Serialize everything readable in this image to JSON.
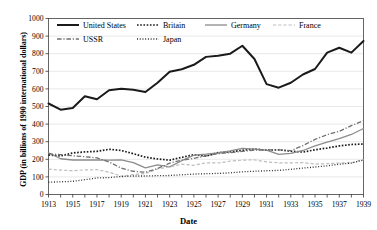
{
  "chart_data": {
    "type": "line",
    "title": "",
    "xlabel": "Date",
    "ylabel": "GDP (in billions of 1990 international dollars)",
    "xlim": [
      1913,
      1939
    ],
    "ylim": [
      0,
      1000
    ],
    "ytick_step": 100,
    "xtick_step": 1,
    "xtick_label_step": 2,
    "grid": true,
    "legend_position": "top-left-inside",
    "x": [
      1913,
      1914,
      1915,
      1916,
      1917,
      1918,
      1919,
      1920,
      1921,
      1922,
      1923,
      1924,
      1925,
      1926,
      1927,
      1928,
      1929,
      1930,
      1931,
      1932,
      1933,
      1934,
      1935,
      1936,
      1937,
      1938,
      1939
    ],
    "xticklabels": [
      "1913",
      "",
      "1915",
      "",
      "1917",
      "",
      "1919",
      "",
      "1921",
      "",
      "1923",
      "",
      "1925",
      "",
      "1927",
      "",
      "1929",
      "",
      "1931",
      "",
      "1933",
      "",
      "1935",
      "",
      "1937",
      "",
      "1939"
    ],
    "yticklabels": [
      "0",
      "100",
      "200",
      "300",
      "400",
      "500",
      "600",
      "700",
      "800",
      "900",
      "1000"
    ],
    "series": [
      {
        "name": "United States",
        "color": "#1a1a1a",
        "width": 2.0,
        "dash": "none",
        "values": [
          517,
          482,
          492,
          558,
          541,
          592,
          601,
          595,
          582,
          635,
          697,
          712,
          737,
          782,
          789,
          800,
          845,
          770,
          627,
          607,
          635,
          682,
          713,
          806,
          834,
          806,
          872
        ]
      },
      {
        "name": "Britain",
        "color": "#1a1a1a",
        "width": 1.7,
        "dash": "dotted",
        "values": [
          225,
          219,
          236,
          242,
          245,
          257,
          250,
          232,
          212,
          202,
          195,
          211,
          226,
          218,
          238,
          243,
          251,
          258,
          252,
          254,
          246,
          241,
          254,
          264,
          276,
          284,
          287
        ]
      },
      {
        "name": "Germany",
        "color": "#8c8c8c",
        "width": 1.3,
        "dash": "none",
        "values": [
          237,
          203,
          196,
          197,
          196,
          195,
          197,
          181,
          151,
          168,
          157,
          192,
          223,
          229,
          237,
          248,
          262,
          258,
          252,
          228,
          234,
          250,
          276,
          297,
          317,
          341,
          375
        ]
      },
      {
        "name": "France",
        "color": "#bdbdbd",
        "width": 1.2,
        "dash": "dashed",
        "values": [
          144,
          139,
          135,
          140,
          141,
          127,
          104,
          113,
          119,
          145,
          157,
          172,
          166,
          180,
          179,
          190,
          195,
          197,
          185,
          180,
          180,
          181,
          173,
          175,
          179,
          180,
          199
        ]
      },
      {
        "name": "USSR",
        "color": "#707070",
        "width": 1.3,
        "dash": "dashdot",
        "values": [
          232,
          226,
          220,
          215,
          208,
          185,
          150,
          132,
          126,
          148,
          178,
          195,
          205,
          220,
          232,
          238,
          245,
          252,
          254,
          253,
          249,
          278,
          313,
          340,
          359,
          391,
          420
        ]
      },
      {
        "name": "Japan",
        "color": "#2a2a2a",
        "width": 1.3,
        "dash": "finedot",
        "values": [
          70,
          72,
          75,
          84,
          94,
          96,
          102,
          105,
          105,
          107,
          108,
          112,
          116,
          118,
          120,
          123,
          129,
          132,
          135,
          137,
          143,
          150,
          156,
          163,
          172,
          179,
          196
        ]
      }
    ]
  },
  "axis": {
    "y_title": "GDP (in billions of 1990 international dollars)",
    "x_title": "Date"
  },
  "legend": {
    "entries": [
      {
        "label": "United States"
      },
      {
        "label": "Britain"
      },
      {
        "label": "Germany"
      },
      {
        "label": "France"
      },
      {
        "label": "USSR"
      },
      {
        "label": "Japan"
      }
    ]
  }
}
